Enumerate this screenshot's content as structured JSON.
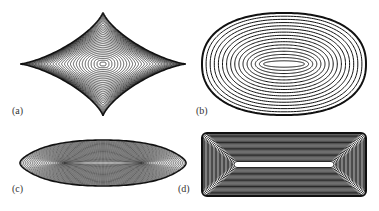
{
  "figure": {
    "panels": [
      {
        "id": "a",
        "label": "(a)",
        "shape": "astroid contour lines",
        "cx": 103,
        "cy": 64,
        "rx": 83,
        "ry": 52,
        "rings": 28
      },
      {
        "id": "b",
        "label": "(b)",
        "shape": "nested ellipse contour lines",
        "cx": 284,
        "cy": 64,
        "rx": 82,
        "ry": 51,
        "rings": 16
      },
      {
        "id": "c",
        "label": "(c)",
        "shape": "lens contour lines",
        "cx": 103,
        "cy": 163,
        "rx": 83,
        "ry": 23,
        "rings": 26
      },
      {
        "id": "d",
        "label": "(d)",
        "shape": "rounded rectangle contour lines",
        "x": 202,
        "y": 133,
        "w": 164,
        "h": 63,
        "rings": 24
      }
    ],
    "colors": {
      "line": "#111111",
      "background": "#ffffff"
    }
  }
}
